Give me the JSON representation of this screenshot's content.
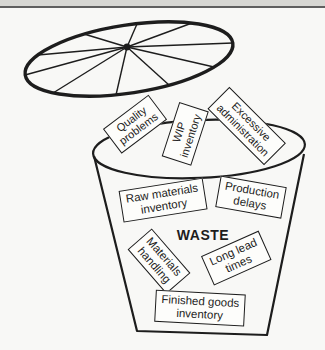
{
  "page": {
    "background_color": "#f8f8f6",
    "top_band_color": "#d7d7d3",
    "top_rule_color": "#5f5f5f",
    "ink_color": "#1d1d1d"
  },
  "diagram": {
    "description_icons": [
      "trash-bin-icon",
      "trash-lid-icon"
    ],
    "waste_label": "WASTE",
    "labels": [
      {
        "id": "quality-problems",
        "text": "Quality\nproblems"
      },
      {
        "id": "wip-inventory",
        "text": "WIP\ninventory"
      },
      {
        "id": "excessive-administration",
        "text": "Excessive\nadministration"
      },
      {
        "id": "raw-materials-inventory",
        "text": "Raw materials\ninventory"
      },
      {
        "id": "production-delays",
        "text": "Production\ndelays"
      },
      {
        "id": "materials-handling",
        "text": "Materials\nhandling"
      },
      {
        "id": "long-lead-times",
        "text": "Long lead\ntimes"
      },
      {
        "id": "finished-goods-inventory",
        "text": "Finished goods\ninventory"
      }
    ]
  }
}
